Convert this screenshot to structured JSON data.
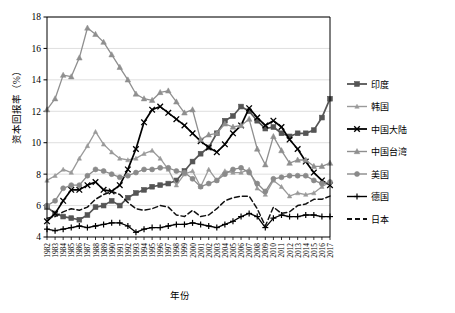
{
  "chart_data": {
    "type": "line",
    "title": "",
    "xlabel": "年份",
    "ylabel": "资本回报率（%）",
    "ylim": [
      4,
      18
    ],
    "ytick_labels": [
      "4",
      "6",
      "8",
      "10",
      "12",
      "14",
      "16",
      "18"
    ],
    "yticks": [
      4,
      6,
      8,
      10,
      12,
      14,
      16,
      18
    ],
    "grid": "horizontal",
    "legend_position": "right",
    "x": [
      1982,
      1983,
      1984,
      1985,
      1986,
      1987,
      1988,
      1989,
      1990,
      1991,
      1992,
      1993,
      1994,
      1995,
      1996,
      1997,
      1998,
      1999,
      2000,
      2001,
      2002,
      2003,
      2004,
      2005,
      2006,
      2007,
      2008,
      2009,
      2010,
      2011,
      2012,
      2013,
      2014,
      2015,
      2016,
      2017
    ],
    "categories": [
      "1982",
      "1983",
      "1984",
      "1985",
      "1986",
      "1987",
      "1988",
      "1989",
      "1990",
      "1991",
      "1992",
      "1993",
      "1994",
      "1995",
      "1996",
      "1997",
      "1998",
      "1999",
      "2000",
      "2001",
      "2002",
      "2003",
      "2004",
      "2005",
      "2006",
      "2007",
      "2008",
      "2009",
      "2010",
      "2011",
      "2012",
      "2013",
      "2014",
      "2015",
      "2016",
      "2017"
    ],
    "series": [
      {
        "name": "印度",
        "color": "#555555",
        "marker": "square",
        "dash": "none",
        "values": [
          5.9,
          5.5,
          5.3,
          5.2,
          5.1,
          5.4,
          5.9,
          6.0,
          6.3,
          6.0,
          6.5,
          6.8,
          7.0,
          7.2,
          7.3,
          7.4,
          7.6,
          8.2,
          8.8,
          9.3,
          9.7,
          10.6,
          11.4,
          11.7,
          12.3,
          12.0,
          11.4,
          10.9,
          11.0,
          10.6,
          10.4,
          10.6,
          10.6,
          10.8,
          11.6,
          12.8
        ]
      },
      {
        "name": "韩国",
        "color": "#9a9a9a",
        "marker": "triangle-small",
        "dash": "none",
        "values": [
          7.6,
          7.9,
          8.3,
          8.1,
          9.0,
          9.8,
          10.7,
          9.9,
          9.4,
          9.0,
          8.9,
          9.0,
          9.3,
          9.5,
          9.0,
          8.3,
          7.3,
          8.0,
          8.2,
          7.2,
          8.3,
          7.6,
          8.2,
          8.1,
          8.1,
          8.3,
          7.1,
          6.7,
          7.6,
          7.2,
          6.6,
          6.8,
          6.7,
          6.8,
          7.2,
          7.5
        ]
      },
      {
        "name": "中国大陆",
        "color": "#000000",
        "marker": "x",
        "dash": "none",
        "values": [
          5.0,
          5.5,
          6.3,
          7.0,
          7.0,
          7.3,
          7.5,
          7.0,
          6.9,
          7.3,
          8.3,
          9.6,
          11.3,
          12.1,
          12.3,
          11.9,
          11.5,
          11.1,
          10.6,
          10.1,
          9.7,
          9.4,
          9.9,
          10.6,
          11.1,
          12.2,
          11.6,
          11.1,
          11.4,
          11.0,
          10.2,
          9.6,
          8.8,
          8.1,
          7.6,
          7.3
        ]
      },
      {
        "name": "中国台湾",
        "color": "#8f8f8f",
        "marker": "triangle",
        "dash": "none",
        "values": [
          12.1,
          12.8,
          14.3,
          14.2,
          15.4,
          17.3,
          16.9,
          16.4,
          15.6,
          14.8,
          14.0,
          13.1,
          12.8,
          12.7,
          13.2,
          13.3,
          12.6,
          11.9,
          12.1,
          10.2,
          10.5,
          10.6,
          11.2,
          11.0,
          11.1,
          11.5,
          9.6,
          8.6,
          10.4,
          9.5,
          8.7,
          8.9,
          8.9,
          8.5,
          8.5,
          8.7
        ]
      },
      {
        "name": "美国",
        "color": "#8a8a8a",
        "marker": "circle",
        "dash": "none",
        "values": [
          6.0,
          6.3,
          7.1,
          7.3,
          7.3,
          7.9,
          8.3,
          8.2,
          8.0,
          7.8,
          7.9,
          8.1,
          8.3,
          8.3,
          8.4,
          8.4,
          8.2,
          8.1,
          7.7,
          7.2,
          7.4,
          7.6,
          8.0,
          8.3,
          8.4,
          8.1,
          7.4,
          6.9,
          7.7,
          7.8,
          7.9,
          7.9,
          7.9,
          7.6,
          7.4,
          7.5
        ]
      },
      {
        "name": "德国",
        "color": "#000000",
        "marker": "plus",
        "dash": "none",
        "values": [
          4.5,
          4.4,
          4.5,
          4.6,
          4.7,
          4.6,
          4.7,
          4.8,
          4.9,
          4.9,
          4.7,
          4.3,
          4.5,
          4.6,
          4.6,
          4.7,
          4.8,
          4.8,
          4.9,
          4.8,
          4.7,
          4.6,
          4.8,
          5.0,
          5.3,
          5.5,
          5.3,
          4.6,
          5.2,
          5.4,
          5.3,
          5.3,
          5.4,
          5.4,
          5.3,
          5.3
        ]
      },
      {
        "name": "日本",
        "color": "#111111",
        "marker": "none",
        "dash": "dashed",
        "values": [
          5.2,
          5.3,
          5.6,
          5.8,
          5.7,
          5.9,
          6.4,
          6.7,
          6.9,
          6.7,
          6.2,
          5.8,
          5.7,
          5.8,
          6.0,
          5.9,
          5.4,
          5.3,
          5.7,
          5.3,
          5.4,
          5.8,
          6.3,
          6.5,
          6.6,
          6.6,
          5.8,
          4.7,
          5.9,
          5.5,
          5.6,
          6.0,
          6.1,
          6.4,
          6.4,
          6.6
        ]
      }
    ]
  },
  "legend": {
    "items": [
      {
        "label": "印度"
      },
      {
        "label": "韩国"
      },
      {
        "label": "中国大陆"
      },
      {
        "label": "中国台湾"
      },
      {
        "label": "美国"
      },
      {
        "label": "德国"
      },
      {
        "label": "日本"
      }
    ]
  }
}
